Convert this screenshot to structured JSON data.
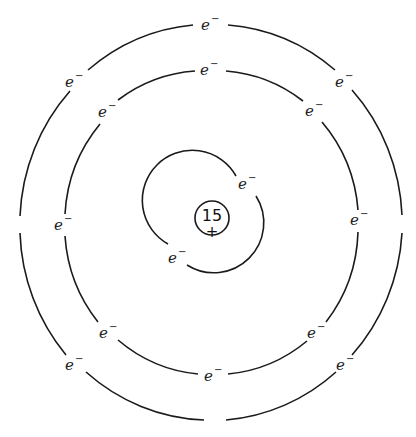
{
  "diagram": {
    "type": "bohr-atom-model",
    "nucleus": {
      "charge_label": "15",
      "sign_label": "+"
    },
    "electron_label": {
      "base": "e",
      "superscript": "−"
    },
    "shells": [
      {
        "name": "inner-shell",
        "electron_count": 2
      },
      {
        "name": "middle-shell",
        "electron_count": 8
      },
      {
        "name": "outer-shell",
        "electron_count": 5
      }
    ],
    "colors": {
      "line": "#1a1a1a",
      "background": "#ffffff"
    }
  }
}
